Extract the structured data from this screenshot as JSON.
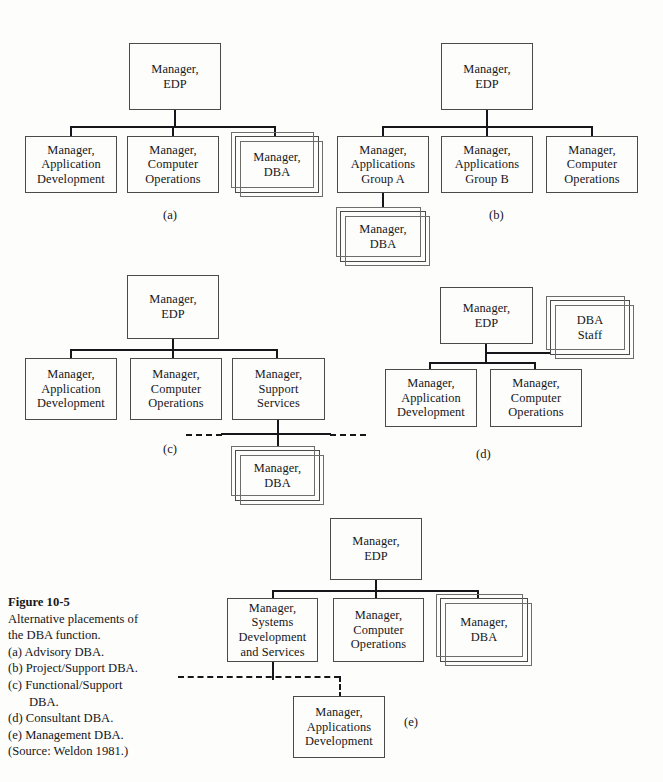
{
  "figure": {
    "number_label": "Figure 10-5",
    "description_line1": "Alternative placements of",
    "description_line2": "the DBA function.",
    "items": [
      {
        "marker": "(a)",
        "text": "Advisory DBA."
      },
      {
        "marker": "(b)",
        "text": "Project/Support DBA."
      },
      {
        "marker": "(c)",
        "text": "Functional/Support",
        "continuation": "DBA."
      },
      {
        "marker": "(d)",
        "text": "Consultant DBA."
      },
      {
        "marker": "(e)",
        "text": "Management DBA."
      }
    ],
    "source": "(Source: Weldon 1981.)"
  },
  "colors": {
    "ink": "#16161a",
    "box_border": "#4a4a48",
    "stack_border": "#6d6d6a",
    "page_background": "#fdfdfb"
  },
  "diagrams": {
    "a": {
      "letter": "(a)",
      "boxes": {
        "root": "Manager,\nEDP",
        "child1": "Manager,\nApplication\nDevelopment",
        "child2": "Manager,\nComputer\nOperations",
        "child3": "Manager,\nDBA"
      }
    },
    "b": {
      "letter": "(b)",
      "boxes": {
        "root": "Manager,\nEDP",
        "child1": "Manager,\nApplications\nGroup A",
        "child2": "Manager,\nApplications\nGroup B",
        "child3": "Manager,\nComputer\nOperations",
        "grandchild": "Manager,\nDBA"
      }
    },
    "c": {
      "letter": "(c)",
      "boxes": {
        "root": "Manager,\nEDP",
        "child1": "Manager,\nApplication\nDevelopment",
        "child2": "Manager,\nComputer\nOperations",
        "child3": "Manager,\nSupport\nServices",
        "grandchild": "Manager,\nDBA"
      }
    },
    "d": {
      "letter": "(d)",
      "boxes": {
        "root": "Manager,\nEDP",
        "staff": "DBA\nStaff",
        "child1": "Manager,\nApplication\nDevelopment",
        "child2": "Manager,\nComputer\nOperations"
      }
    },
    "e": {
      "letter": "(e)",
      "boxes": {
        "root": "Manager,\nEDP",
        "child1": "Manager,\nSystems\nDevelopment\nand Services",
        "child2": "Manager,\nComputer\nOperations",
        "child3": "Manager,\nDBA",
        "grandchild": "Manager,\nApplications\nDevelopment"
      }
    }
  }
}
